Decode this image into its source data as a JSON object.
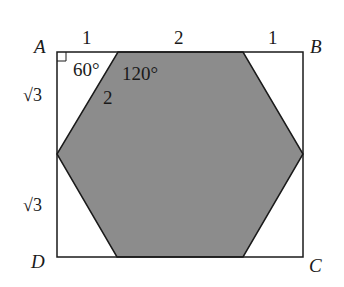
{
  "diagram": {
    "type": "geometry",
    "vertices": {
      "A": "A",
      "B": "B",
      "C": "C",
      "D": "D"
    },
    "top_segments": [
      "1",
      "2",
      "1"
    ],
    "left_segments": [
      "√3",
      "√3"
    ],
    "angles": {
      "corner_angle": "60°",
      "hexagon_interior": "120°"
    },
    "hexagon_side": "2",
    "colors": {
      "hexagon_fill": "#8c8c8c",
      "stroke": "#1a1a1a",
      "background": "#ffffff"
    }
  }
}
